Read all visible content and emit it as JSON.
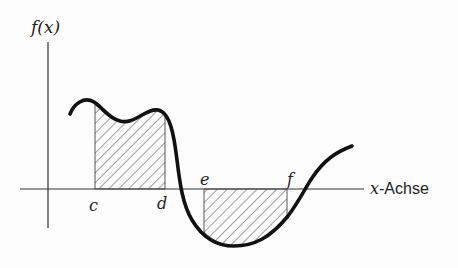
{
  "diagram": {
    "y_axis_label": "f(x)",
    "x_axis_label_var": "x",
    "x_axis_label_text": "-Achse",
    "points": {
      "c": "c",
      "d": "d",
      "e": "e",
      "f": "f"
    },
    "colors": {
      "ink": "#111111",
      "axis": "#333333",
      "hatch": "#444444",
      "background": "#fdfdfd"
    }
  }
}
